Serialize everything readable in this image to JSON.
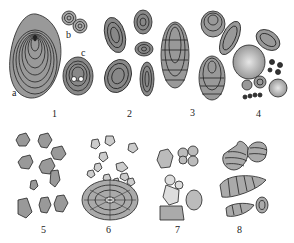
{
  "figure": {
    "panels": [
      {
        "number": "1",
        "sublabels": [
          "a",
          "b",
          "c"
        ]
      },
      {
        "number": "2"
      },
      {
        "number": "3"
      },
      {
        "number": "4"
      },
      {
        "number": "5"
      },
      {
        "number": "6"
      },
      {
        "number": "7"
      },
      {
        "number": "8"
      }
    ]
  },
  "colors": {
    "ink": "#222222",
    "fill": "#cfcfcf",
    "background": "#ffffff"
  }
}
